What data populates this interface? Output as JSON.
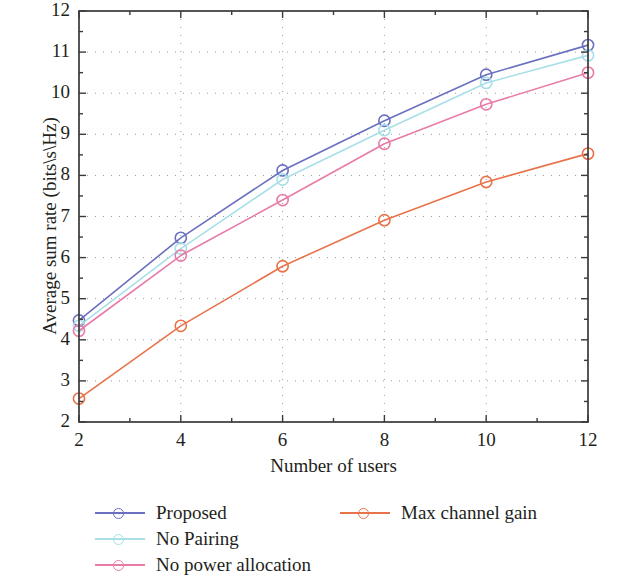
{
  "chart_data": {
    "type": "line",
    "title": "",
    "xlabel": "Number of users",
    "ylabel": "Average sum rate (bits\\s\\Hz)",
    "x": [
      2,
      4,
      6,
      8,
      10,
      12
    ],
    "xlim": [
      2,
      12
    ],
    "ylim": [
      2,
      12
    ],
    "xticks": [
      "2",
      "4",
      "6",
      "8",
      "10",
      "12"
    ],
    "yticks": [
      "2",
      "3",
      "4",
      "5",
      "6",
      "7",
      "8",
      "9",
      "10",
      "11",
      "12"
    ],
    "grid": "dotted",
    "legend_position": "below-plot",
    "marker": "circle-open",
    "series": [
      {
        "name": "Proposed",
        "color": "#6b6fc0",
        "values": [
          4.47,
          6.48,
          8.12,
          9.33,
          10.45,
          11.17
        ]
      },
      {
        "name": "No Pairing",
        "color": "#a8dfe8",
        "values": [
          4.34,
          6.22,
          7.9,
          9.1,
          10.25,
          10.92
        ]
      },
      {
        "name": "No power allocation",
        "color": "#e87ba8",
        "values": [
          4.22,
          6.05,
          7.4,
          8.77,
          9.73,
          10.5
        ]
      },
      {
        "name": "Max channel gain",
        "color": "#e8734a",
        "values": [
          2.57,
          4.34,
          5.79,
          6.91,
          7.84,
          8.53
        ]
      }
    ]
  },
  "axes": {
    "x_title": "Number of users",
    "y_title": "Average sum rate (bits\\s\\Hz)",
    "x_tick_labels": [
      "2",
      "4",
      "6",
      "8",
      "10",
      "12"
    ],
    "y_tick_labels": [
      "12",
      "11",
      "10",
      "9",
      "8",
      "7",
      "6",
      "5",
      "4",
      "3",
      "2"
    ],
    "frame_color": "#3a3a3a",
    "grid_color": "#9a9a9a"
  },
  "legend": {
    "entries": [
      {
        "label": "Proposed",
        "color": "#6b6fc0"
      },
      {
        "label": "No Pairing",
        "color": "#a8dfe8"
      },
      {
        "label": "No power allocation",
        "color": "#e87ba8"
      },
      {
        "label": "Max channel gain",
        "color": "#e8734a"
      }
    ]
  }
}
